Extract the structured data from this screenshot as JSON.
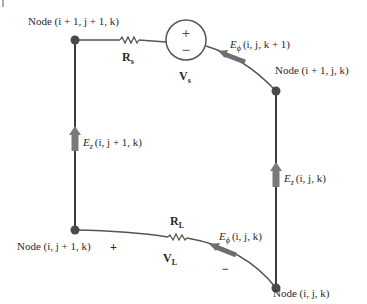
{
  "diagram": {
    "colors": {
      "wire": "#3a3a3a",
      "node": "#4a4a4a",
      "arrow": "#7a7a7a",
      "text": "#2a2a2a"
    },
    "nodes": {
      "top_left": {
        "label_prefix": "Node (",
        "i": "i",
        "rest": " + 1, ",
        "j": "j",
        "rest2": " + 1, ",
        "k": "k",
        "close": ")",
        "full": "Node (i + 1, j + 1, k)"
      },
      "top_right": {
        "full": "Node (i + 1, j, k)"
      },
      "bottom_left": {
        "full": "Node (i, j + 1, k)"
      },
      "bottom_right": {
        "full": "Node (i, j, k)"
      }
    },
    "components": {
      "source_resistor": {
        "symbol": "R",
        "subscript": "s"
      },
      "voltage_source": {
        "symbol": "V",
        "subscript": "s",
        "plus": "+",
        "minus": "−"
      },
      "load_resistor": {
        "symbol": "R",
        "subscript": "L"
      },
      "load_voltage": {
        "symbol": "V",
        "subscript": "L",
        "plus": "+",
        "minus": "−"
      }
    },
    "fields": {
      "e_phi_top": {
        "symbol": "E",
        "subscript": "ϕ",
        "args": "(i, j, k + 1)"
      },
      "e_phi_bottom": {
        "symbol": "E",
        "subscript": "ϕ",
        "args": "(i, j, k)"
      },
      "e_z_left": {
        "symbol": "E",
        "subscript": "z",
        "args": "(i, j + 1, k)"
      },
      "e_z_right": {
        "symbol": "E",
        "subscript": "z",
        "args": "(i, j, k)"
      }
    }
  }
}
